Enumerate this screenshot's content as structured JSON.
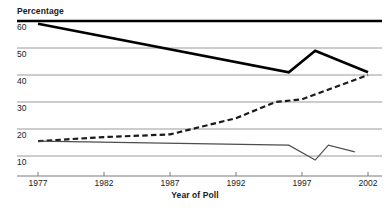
{
  "chart_data": {
    "type": "line",
    "title": "",
    "ylabel": "Percentage",
    "xlabel": "Year of Poll",
    "xlim": [
      1977,
      2002
    ],
    "ylim": [
      6,
      60
    ],
    "yticks": [
      60,
      50,
      40,
      30,
      20,
      10
    ],
    "xticks": [
      1977,
      1982,
      1987,
      1992,
      1997,
      2002
    ],
    "grid": true,
    "legend": "none",
    "series": [
      {
        "name": "series-thick-declining",
        "style": "solid-thick",
        "color": "#000000",
        "points": [
          {
            "x": 1977,
            "y": 59
          },
          {
            "x": 1996,
            "y": 41
          },
          {
            "x": 1998,
            "y": 49
          },
          {
            "x": 2002,
            "y": 41
          }
        ]
      },
      {
        "name": "series-dashed-rising",
        "style": "dashed",
        "color": "#1a1a1a",
        "points": [
          {
            "x": 1977,
            "y": 15.5
          },
          {
            "x": 1982,
            "y": 17
          },
          {
            "x": 1987,
            "y": 18
          },
          {
            "x": 1992,
            "y": 24
          },
          {
            "x": 1995,
            "y": 30
          },
          {
            "x": 1997,
            "y": 31
          },
          {
            "x": 2002,
            "y": 40
          }
        ]
      },
      {
        "name": "series-thin-flat",
        "style": "solid-thin",
        "color": "#4d4d4d",
        "points": [
          {
            "x": 1977,
            "y": 15.5
          },
          {
            "x": 1996,
            "y": 14
          },
          {
            "x": 1998,
            "y": 8.5
          },
          {
            "x": 1999,
            "y": 14
          },
          {
            "x": 2001,
            "y": 11.5
          }
        ]
      }
    ]
  },
  "axes": {
    "y_title": "Percentage",
    "x_title": "Year of Poll",
    "y_tick_labels": [
      "60",
      "50",
      "40",
      "30",
      "20",
      "10"
    ],
    "x_tick_labels": [
      "1977",
      "1982",
      "1987",
      "1992",
      "1997",
      "2002"
    ]
  },
  "colors": {
    "gridline": "#9a9a9a",
    "topRule": "#000000",
    "axisLine": "#7a7a7a",
    "text": "#1a1a1a",
    "thick_series": "#000000",
    "dashed_series": "#1a1a1a",
    "thin_series": "#4d4d4d"
  }
}
